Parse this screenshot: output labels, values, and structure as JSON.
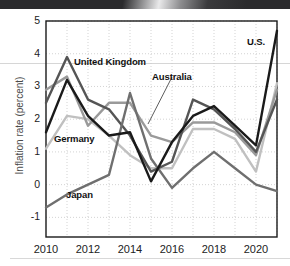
{
  "figure": {
    "kind": "line-chart-figure",
    "background": "#ffffff",
    "banner_color": "#2b2b2d"
  },
  "axis": {
    "y_label": "Inflation rate (percent)",
    "y_ticks": [
      "5",
      "4",
      "3",
      "2",
      "1",
      "0",
      "-1"
    ],
    "y_tick_values": [
      5,
      4,
      3,
      2,
      1,
      0,
      -1
    ],
    "x_ticks": [
      "2010",
      "2012",
      "2014",
      "2016",
      "2018",
      "2020"
    ],
    "x_tick_values": [
      2010,
      2012,
      2014,
      2016,
      2018,
      2020
    ]
  },
  "annotations": [
    {
      "name": "united-kingdom",
      "text": "United Kingdom",
      "x": 74,
      "y": 56
    },
    {
      "name": "australia",
      "text": "Australia",
      "x": 152,
      "y": 71
    },
    {
      "name": "germany",
      "text": "Germany",
      "x": 54,
      "y": 133
    },
    {
      "name": "japan",
      "text": "Japan",
      "x": 66,
      "y": 189
    },
    {
      "name": "united-states",
      "text": "U.S.",
      "x": 247,
      "y": 36
    }
  ],
  "colors": {
    "united_states": "#1a1a1a",
    "united_kingdom": "#555555",
    "australia": "#9a9a9a",
    "germany": "#c0c0c0",
    "japan": "#6f6f6f",
    "grid": "#c8c8c8",
    "frame": "#1a1a1a",
    "text": "#1a1a1a"
  },
  "chart_data": {
    "type": "line",
    "title": "",
    "xlabel": "",
    "ylabel": "Inflation rate (percent)",
    "xlim": [
      2010,
      2021
    ],
    "ylim": [
      -1.6,
      5.0
    ],
    "grid": true,
    "legend": "inline-annotations",
    "x": [
      2010,
      2011,
      2012,
      2013,
      2014,
      2015,
      2016,
      2017,
      2018,
      2019,
      2020,
      2021
    ],
    "series": [
      {
        "name": "U.S.",
        "color": "#1a1a1a",
        "values": [
          1.6,
          3.2,
          2.1,
          1.5,
          1.6,
          0.1,
          1.3,
          2.1,
          2.4,
          1.8,
          1.2,
          4.7
        ]
      },
      {
        "name": "United Kingdom",
        "color": "#555555",
        "values": [
          2.5,
          3.9,
          2.6,
          2.3,
          1.5,
          0.4,
          0.7,
          2.6,
          2.3,
          1.7,
          1.0,
          2.6
        ]
      },
      {
        "name": "Australia",
        "color": "#9a9a9a",
        "values": [
          2.9,
          3.3,
          1.8,
          2.5,
          2.5,
          1.5,
          1.3,
          1.9,
          1.9,
          1.6,
          0.9,
          2.9
        ]
      },
      {
        "name": "Germany",
        "color": "#c0c0c0",
        "values": [
          1.1,
          2.1,
          2.0,
          1.5,
          0.9,
          0.5,
          0.5,
          1.7,
          1.7,
          1.4,
          0.4,
          3.1
        ]
      },
      {
        "name": "Japan",
        "color": "#6f6f6f",
        "values": [
          -0.7,
          -0.3,
          0.0,
          0.3,
          2.8,
          0.8,
          -0.1,
          0.5,
          1.0,
          0.5,
          0.0,
          -0.2
        ]
      }
    ]
  }
}
